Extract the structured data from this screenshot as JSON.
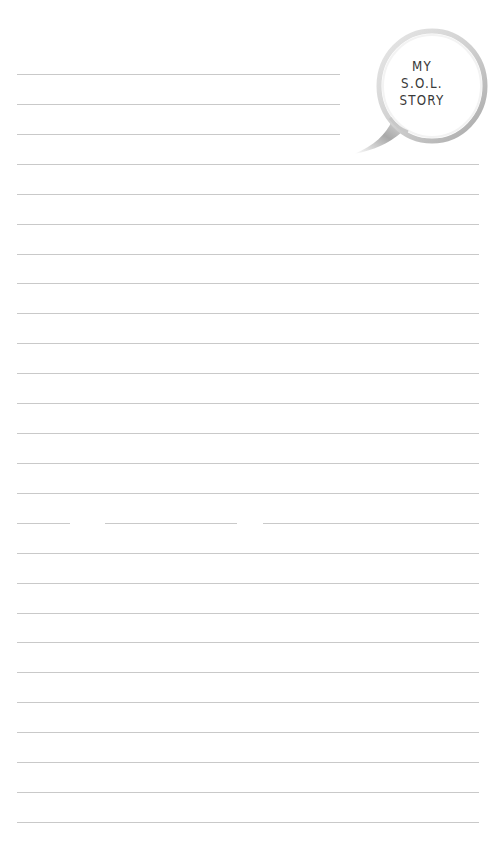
{
  "title": {
    "line1": "MY",
    "line2": "S.O.L.",
    "line3": "STORY"
  },
  "lines": {
    "count": 26,
    "short_count": 3,
    "first_y": 74,
    "spacing": 29.92,
    "color": "#c9c9c9"
  },
  "colors": {
    "background": "#ffffff",
    "text": "#3a3a3a",
    "bubble_outline": "#bdbdbd"
  }
}
